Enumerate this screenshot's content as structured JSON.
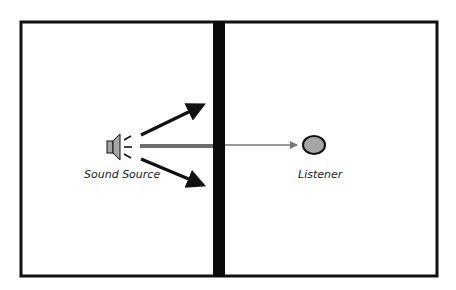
{
  "diagram": {
    "type": "sound-transmission-through-wall",
    "rooms": [
      "left-room",
      "right-room"
    ],
    "labels": {
      "source": "Sound Source",
      "listener": "Listener"
    },
    "colors": {
      "outline": "#111111",
      "wall": "#0a0a0a",
      "speaker_fill": "#a6a6a6",
      "listener_fill": "#a6a6a6",
      "direct_path": "#6e6e6e",
      "transmitted_path": "#777777",
      "reflection_arrows": "#111111"
    }
  }
}
